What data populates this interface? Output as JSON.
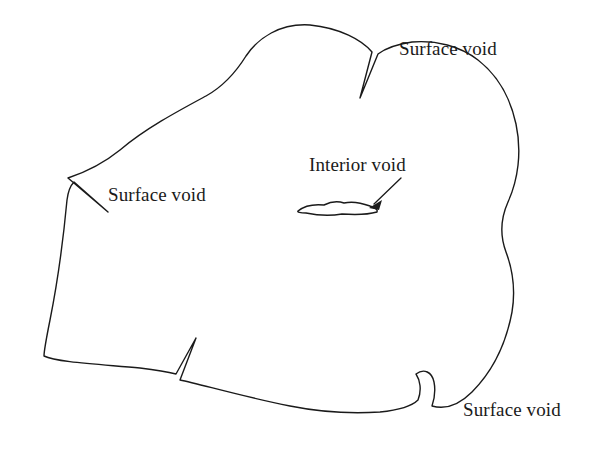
{
  "figure": {
    "kind": "technical line diagram",
    "background_color": "#ffffff",
    "line_color": "#1a1a1a"
  },
  "labels": {
    "surface_void_top_right": "Surface void",
    "surface_void_left": "Surface void",
    "interior_void": "Interior void",
    "surface_void_bottom_right": "Surface void"
  },
  "geometry": {
    "outline": "M 310 25 C 280 23 258 38 246 56 C 236 72 224 86 206 96 C 180 110 146 128 120 150 C 104 163 86 172 68 178 L 108 212 L 74 182 C 70 186 68 192 67 200 C 64 232 58 280 50 320 C 46 340 44 350 44 356 C 56 362 96 364 140 368 C 156 370 168 372 176 374 L 196 338 L 180 380 C 200 384 240 396 290 406 C 320 412 350 414 380 412 C 400 410 412 406 418 400 C 422 390 420 380 416 374 C 424 368 432 372 434 382 C 436 392 434 400 432 406 C 446 410 460 404 472 392 C 492 372 506 344 512 312 C 516 288 512 268 506 252 C 500 236 500 220 508 202 C 518 180 522 152 516 124 C 510 96 496 74 478 60 C 460 46 436 40 412 42 C 398 44 386 48 378 54 L 360 98 L 372 52 C 362 40 340 28 310 25 Z",
    "interior_void": "M 298 211 C 304 206 314 204 324 205 C 330 202 338 201 344 203 C 352 201 362 203 370 206 C 376 208 378 210 377 212 C 370 214 356 215 342 214 C 330 216 316 215 306 213 C 300 213 297 212 298 211 Z",
    "pointer_line": "M 401 178 L 374 204",
    "pointer_head": "M 369 208 L 382 200 L 379 210 Z"
  }
}
